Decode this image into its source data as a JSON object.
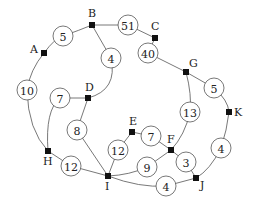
{
  "diagram": {
    "type": "weighted-graph",
    "nodes": [
      {
        "id": "A",
        "label": "A"
      },
      {
        "id": "B",
        "label": "B"
      },
      {
        "id": "C",
        "label": "C"
      },
      {
        "id": "D",
        "label": "D"
      },
      {
        "id": "E",
        "label": "E"
      },
      {
        "id": "F",
        "label": "F"
      },
      {
        "id": "G",
        "label": "G"
      },
      {
        "id": "H",
        "label": "H"
      },
      {
        "id": "I",
        "label": "I"
      },
      {
        "id": "J",
        "label": "J"
      },
      {
        "id": "K",
        "label": "K"
      }
    ],
    "edges": [
      {
        "from": "A",
        "to": "B",
        "weight": "5"
      },
      {
        "from": "B",
        "to": "C",
        "weight": "51"
      },
      {
        "from": "C",
        "to": "G",
        "weight": "40"
      },
      {
        "from": "B",
        "to": "D",
        "weight": "4"
      },
      {
        "from": "A",
        "to": "H",
        "weight": "10"
      },
      {
        "from": "D",
        "to": "H",
        "weight": "7"
      },
      {
        "from": "D",
        "to": "I",
        "weight": "8"
      },
      {
        "from": "H",
        "to": "I",
        "weight": "12"
      },
      {
        "from": "E",
        "to": "I",
        "weight": "12"
      },
      {
        "from": "E",
        "to": "F",
        "weight": "7"
      },
      {
        "from": "G",
        "to": "F",
        "weight": "13"
      },
      {
        "from": "G",
        "to": "K",
        "weight": "5"
      },
      {
        "from": "K",
        "to": "J",
        "weight": "4"
      },
      {
        "from": "F",
        "to": "J",
        "weight": "3"
      },
      {
        "from": "F",
        "to": "I",
        "weight": "9"
      },
      {
        "from": "I",
        "to": "J",
        "weight": "4"
      }
    ]
  }
}
